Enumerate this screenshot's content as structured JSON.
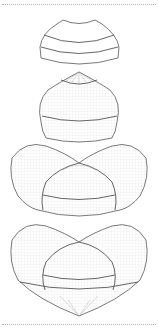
{
  "figure": {
    "title": "",
    "panel_count": 4,
    "panels": [
      {
        "id": "stage-1",
        "label": "",
        "shape": "flat-dome band"
      },
      {
        "id": "stage-2",
        "label": "",
        "shape": "rounded dome with peaked cap"
      },
      {
        "id": "stage-3",
        "label": "",
        "shape": "winged shell with inner dome"
      },
      {
        "id": "stage-4",
        "label": "",
        "shape": "heart-shaped shell with inner dome"
      }
    ]
  },
  "colors": {
    "outline": "#6a6a6a",
    "mesh": "#cfcfcf",
    "separator": "#b8b8b8",
    "background": "#ffffff"
  }
}
